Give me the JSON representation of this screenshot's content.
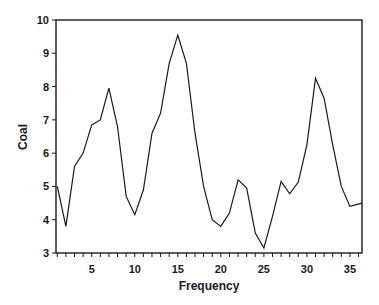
{
  "chart_data": {
    "type": "line",
    "title": "",
    "xlabel": "Frequency",
    "ylabel": "Coal",
    "xlim": [
      0.85,
      36.4
    ],
    "ylim": [
      3,
      10
    ],
    "x_ticks": [
      1,
      2,
      3,
      4,
      5,
      6,
      7,
      8,
      9,
      10,
      11,
      12,
      13,
      14,
      15,
      16,
      17,
      18,
      19,
      20,
      21,
      22,
      23,
      24,
      25,
      26,
      27,
      28,
      29,
      30,
      31,
      32,
      33,
      34,
      35,
      36
    ],
    "x_tick_labels": [
      "5",
      "10",
      "15",
      "20",
      "25",
      "30",
      "35"
    ],
    "x_tick_label_values": [
      5,
      10,
      15,
      20,
      25,
      30,
      35
    ],
    "y_ticks": [
      3,
      4,
      5,
      6,
      7,
      8,
      9,
      10
    ],
    "y_tick_labels": [
      "3",
      "4",
      "5",
      "6",
      "7",
      "8",
      "9",
      "10"
    ],
    "grid": false,
    "legend": null,
    "frame": "box",
    "series": [
      {
        "name": "Coal",
        "color": "#1a1a1a",
        "x": [
          1,
          2,
          3,
          4,
          5,
          6,
          7,
          8,
          9,
          10,
          11,
          12,
          13,
          14,
          15,
          16,
          17,
          18,
          19,
          20,
          21,
          22,
          23,
          24,
          25,
          26,
          27,
          28,
          29,
          30,
          31,
          32,
          33,
          34,
          35,
          36.4
        ],
        "values": [
          5.0,
          3.8,
          5.6,
          6.0,
          6.85,
          7.0,
          7.95,
          6.8,
          4.7,
          4.15,
          4.9,
          6.6,
          7.2,
          8.7,
          9.55,
          8.7,
          6.6,
          5.0,
          4.0,
          3.8,
          4.2,
          5.2,
          4.95,
          3.6,
          3.15,
          4.1,
          5.15,
          4.78,
          5.13,
          6.25,
          8.25,
          7.65,
          6.25,
          5.0,
          4.4,
          4.5
        ]
      }
    ]
  }
}
